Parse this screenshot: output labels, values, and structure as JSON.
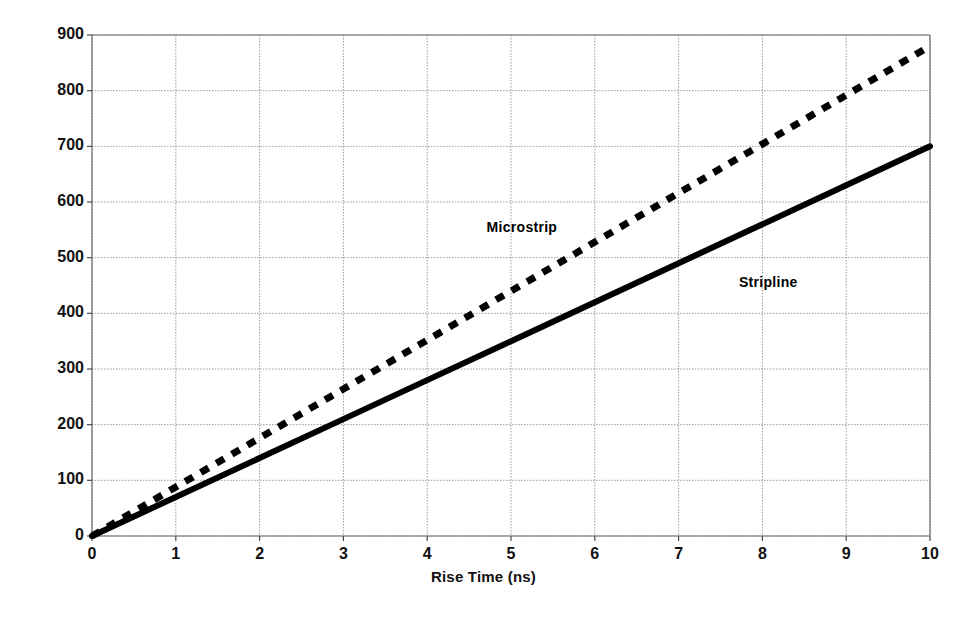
{
  "chart_data": {
    "type": "line",
    "title": "",
    "xlabel": "Rise Time (ns)",
    "ylabel": "Critical Length (mm)",
    "xlim": [
      0,
      10
    ],
    "ylim": [
      0,
      900
    ],
    "x_ticks": [
      "0",
      "1",
      "2",
      "3",
      "4",
      "5",
      "6",
      "7",
      "8",
      "9",
      "10"
    ],
    "y_ticks": [
      "0",
      "100",
      "200",
      "300",
      "400",
      "500",
      "600",
      "700",
      "800",
      "900"
    ],
    "grid": true,
    "legend_position": "inline-annotations",
    "series": [
      {
        "name": "Microstrip",
        "style": "dashed",
        "color": "#000000",
        "label_x": 5.13,
        "label_y": 555,
        "x": [
          0,
          1,
          2,
          3,
          4,
          5,
          6,
          7,
          8,
          9,
          10
        ],
        "values": [
          0,
          88,
          176,
          264,
          352,
          440,
          528,
          616,
          704,
          792,
          880
        ]
      },
      {
        "name": "Stripline",
        "style": "solid",
        "color": "#000000",
        "label_x": 8.07,
        "label_y": 456,
        "x": [
          0,
          1,
          2,
          3,
          4,
          5,
          6,
          7,
          8,
          9,
          10
        ],
        "values": [
          0,
          70,
          140,
          210,
          280,
          350,
          420,
          490,
          560,
          630,
          700
        ]
      }
    ]
  },
  "axes": {
    "x_title": "Rise Time (ns)",
    "y_title": "Critical Length (mm)"
  },
  "annotations": {
    "microstrip_label": "Microstrip",
    "stripline_label": "Stripline"
  }
}
